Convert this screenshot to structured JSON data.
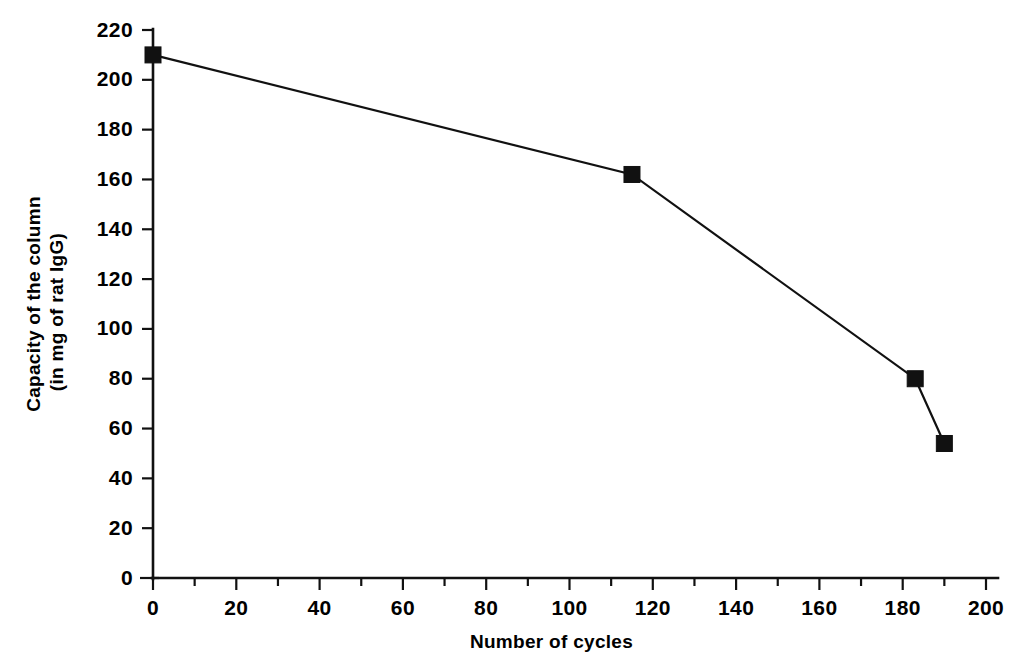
{
  "chart_data": {
    "type": "line",
    "title": "",
    "subtitle": "",
    "xlabel": "Number of cycles",
    "ylabel_line1": "Capacity of the column",
    "ylabel_line2": "(in mg of rat IgG)",
    "ylabel": "Capacity of the column (in mg of rat IgG)",
    "xlim": [
      0,
      200
    ],
    "ylim": [
      0,
      220
    ],
    "xticks": [
      0,
      20,
      40,
      60,
      80,
      100,
      120,
      140,
      160,
      180,
      200
    ],
    "xticklabels": [
      "0",
      "20",
      "40",
      "60",
      "80",
      "100",
      "120",
      "140",
      "160",
      "180",
      "200"
    ],
    "x_minor_ticks": [
      10,
      30,
      50,
      70,
      90,
      110,
      130,
      150,
      170,
      190
    ],
    "yticks": [
      0,
      20,
      40,
      60,
      80,
      100,
      120,
      140,
      160,
      180,
      200,
      220
    ],
    "yticklabels": [
      "0",
      "20",
      "40",
      "60",
      "80",
      "100",
      "120",
      "140",
      "160",
      "180",
      "200",
      "220"
    ],
    "grid": false,
    "legend": false,
    "legend_position": "none",
    "marker": "square",
    "line_color": "#111111",
    "marker_color": "#111111",
    "background_color": "#ffffff",
    "series": [
      {
        "name": "Column capacity",
        "x": [
          0,
          115,
          183,
          190
        ],
        "values": [
          210,
          162,
          80,
          54
        ]
      }
    ]
  }
}
